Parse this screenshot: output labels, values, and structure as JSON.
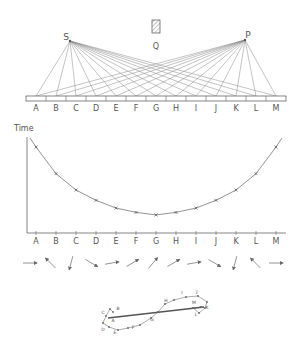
{
  "source_labels": {
    "s": "S",
    "p": "P",
    "q": "Q"
  },
  "mirror_segments": [
    "A",
    "B",
    "C",
    "D",
    "E",
    "F",
    "G",
    "H",
    "I",
    "J",
    "K",
    "L",
    "M"
  ],
  "graph": {
    "ylabel": "Time",
    "categories": [
      "A",
      "B",
      "C",
      "D",
      "E",
      "F",
      "G",
      "H",
      "I",
      "J",
      "K",
      "L",
      "M"
    ],
    "marker": "x"
  },
  "chart_data": {
    "type": "line",
    "title": "",
    "xlabel": "",
    "ylabel": "Time",
    "categories": [
      "A",
      "B",
      "C",
      "D",
      "E",
      "F",
      "G",
      "H",
      "I",
      "J",
      "K",
      "L",
      "M"
    ],
    "values": [
      10.0,
      6.9,
      5.0,
      3.8,
      2.9,
      2.4,
      2.1,
      2.4,
      2.9,
      3.8,
      5.0,
      6.9,
      10.0
    ],
    "grid": false,
    "note": "Relative travel time S→mirror→P, minimum at G"
  },
  "arrows": {
    "angles_deg": [
      0,
      -135,
      105,
      30,
      -10,
      -30,
      -50,
      -30,
      -10,
      30,
      105,
      -135,
      0
    ]
  },
  "spiral": {
    "labels": [
      "A",
      "B",
      "C",
      "D",
      "E",
      "F",
      "G",
      "H",
      "I",
      "J",
      "K",
      "L",
      "M"
    ]
  },
  "colors": {
    "line": "#777777",
    "text": "#555555",
    "hatch": "#888888"
  }
}
